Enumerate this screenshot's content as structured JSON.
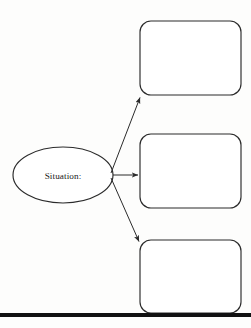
{
  "diagram": {
    "type": "graphic-organizer",
    "title": "",
    "background_color": "#fdfdfc",
    "stroke_color": "#2b2b2b",
    "fill_color": "#ffffff",
    "nodes": [
      {
        "id": "situation",
        "shape": "ellipse",
        "label": "Situation:",
        "cx": 63,
        "cy": 175,
        "rx": 50,
        "ry": 28
      },
      {
        "id": "box-top",
        "shape": "rounded-rect",
        "label": "",
        "x": 140,
        "y": 21,
        "width": 101,
        "height": 74,
        "radius": 11
      },
      {
        "id": "box-middle",
        "shape": "rounded-rect",
        "label": "",
        "x": 140,
        "y": 134,
        "width": 101,
        "height": 74,
        "radius": 11
      },
      {
        "id": "box-bottom",
        "shape": "rounded-rect",
        "label": "",
        "x": 140,
        "y": 240,
        "width": 101,
        "height": 73,
        "radius": 11
      }
    ],
    "connectors": [
      {
        "id": "arrow-to-top",
        "from": "situation",
        "to": "box-top",
        "x1": 111,
        "y1": 173,
        "x2": 140,
        "y2": 96,
        "arrowhead": "end"
      },
      {
        "id": "arrow-to-middle",
        "from": "situation",
        "to": "box-middle",
        "x1": 113,
        "y1": 175,
        "x2": 139,
        "y2": 175,
        "arrowhead": "end"
      },
      {
        "id": "arrow-to-bottom",
        "from": "situation",
        "to": "box-bottom",
        "x1": 111,
        "y1": 178,
        "x2": 139,
        "y2": 243,
        "arrowhead": "end"
      }
    ],
    "footer_rule": {
      "id": "bottom-rule",
      "x1": 0,
      "y1": 315,
      "x2": 251,
      "y2": 315,
      "thickness": 4,
      "color": "#111111"
    }
  }
}
